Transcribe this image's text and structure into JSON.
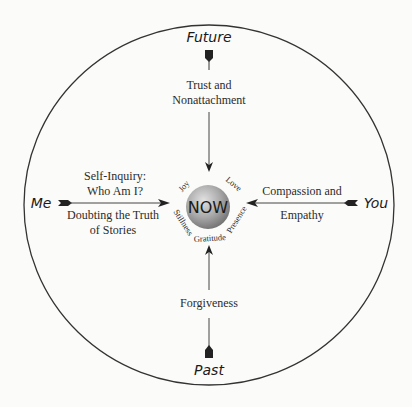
{
  "diagram": {
    "center": {
      "label": "NOW",
      "qualities": [
        "Joy",
        "Love",
        "Presence",
        "Gratitude",
        "Stillness"
      ]
    },
    "directions": {
      "top": {
        "label": "Future",
        "practice_lines": [
          "Trust and",
          "Nonattachment"
        ]
      },
      "left": {
        "label": "Me",
        "practice_lines_above": [
          "Self-Inquiry:",
          "Who Am I?"
        ],
        "practice_lines_below": [
          "Doubting the Truth",
          "of Stories"
        ]
      },
      "right": {
        "label": "You",
        "practice_lines_above": [
          "Compassion and"
        ],
        "practice_lines_below": [
          "Empathy"
        ]
      },
      "bottom": {
        "label": "Past",
        "practice_lines": [
          "Forgiveness"
        ]
      }
    },
    "colors": {
      "line": "#333333",
      "sphere_light": "#d8d8d8",
      "sphere_dark": "#7a7a7a",
      "background": "#fbfbf9"
    }
  }
}
